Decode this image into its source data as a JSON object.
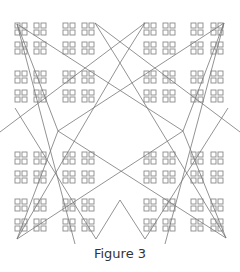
{
  "figure": {
    "caption": "Figure 3",
    "stroke_color": "#777777",
    "square_color": "#8a8a8a",
    "group_columns_x": [
      15,
      34,
      63,
      82,
      144,
      163,
      191,
      211
    ],
    "group_rows_y": [
      23,
      42,
      71,
      90,
      152,
      171,
      199,
      219
    ],
    "lines": [
      [
        17,
        24,
        58,
        131
      ],
      [
        58,
        131,
        17,
        239
      ],
      [
        224,
        23,
        183,
        131
      ],
      [
        183,
        131,
        226,
        238
      ],
      [
        95,
        23,
        120,
        63
      ],
      [
        120,
        63,
        145,
        23
      ],
      [
        96,
        239,
        120,
        200
      ],
      [
        120,
        200,
        145,
        239
      ],
      [
        17,
        24,
        183,
        131
      ],
      [
        224,
        23,
        58,
        131
      ],
      [
        17,
        239,
        183,
        131
      ],
      [
        226,
        238,
        58,
        131
      ],
      [
        95,
        23,
        240,
        132
      ],
      [
        145,
        23,
        0,
        132
      ],
      [
        17,
        24,
        75,
        244
      ],
      [
        224,
        23,
        165,
        244
      ],
      [
        17,
        239,
        120,
        63
      ],
      [
        226,
        238,
        120,
        63
      ],
      [
        96,
        239,
        15,
        108
      ],
      [
        145,
        239,
        228,
        108
      ]
    ]
  }
}
